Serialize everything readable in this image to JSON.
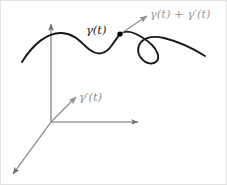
{
  "figure": {
    "canvas": {
      "width": 227,
      "height": 185,
      "background": "#ffffff"
    },
    "colors": {
      "curve": "#1a1a1a",
      "axis": "#6f6f6f",
      "tangent_vector": "#8f8f8f",
      "point_marker": "#000000",
      "label_dark": "#1a1a1a",
      "label_gray": "#9a9a9a",
      "border": "#d8d8d8"
    },
    "labels": {
      "point_label": "γ(t)",
      "tip_label": "γ(t) + γ′(t)",
      "vector_label": "γ′(t)"
    },
    "axes": {
      "origin": {
        "x": 51,
        "y": 122
      },
      "vertical_axis_tip": {
        "x": 51,
        "y": 22
      },
      "horizontal_axis_tip": {
        "x": 140,
        "y": 122
      },
      "depth_axis_tip": {
        "x": 11,
        "y": 176
      }
    },
    "point_marker": {
      "x": 120,
      "y": 34,
      "radius": 2.6
    },
    "tangent_at_point": {
      "from": {
        "x": 120,
        "y": 34
      },
      "to": {
        "x": 149,
        "y": 15
      }
    },
    "tangent_at_origin": {
      "from": {
        "x": 51,
        "y": 122
      },
      "to": {
        "x": 78,
        "y": 95
      }
    },
    "curve_path": "M 22,62 C 33,44 48,32 62,33 C 76,34 82,44 90,50 C 98,56 106,54 112,45 C 117,38 119,35 120,34 C 124,31 130,31 136,34 C 142,37 148,41 152,45 C 157,50 160,57 157,61 C 153,65 146,64 142,59 C 137,54 137,47 141,42 C 146,37 155,36 164,38 C 176,41 191,47 205,56",
    "curve_segments": [
      {
        "name": "rise-to-first-crest",
        "description": "curve rises from lower-left to first crest"
      },
      {
        "name": "trough",
        "description": "dips to a trough mid-figure"
      },
      {
        "name": "marked-point",
        "description": "passes through the marked point gamma(t)"
      },
      {
        "name": "loop",
        "description": "forms a small clockwise loop to the right"
      },
      {
        "name": "tail",
        "description": "descends to the right edge"
      }
    ]
  },
  "chart_data": {
    "type": "line",
    "xlabel": "",
    "ylabel": "",
    "annotations": [
      {
        "text": "γ(t)",
        "x": 86,
        "y": 25,
        "color": "#1a1a1a"
      },
      {
        "text": "γ(t) + γ′(t)",
        "x": 150,
        "y": 9,
        "color": "#9a9a9a"
      },
      {
        "text": "γ′(t)",
        "x": 79,
        "y": 92,
        "color": "#8f8f8f"
      }
    ],
    "legend": [],
    "grid": false
  }
}
